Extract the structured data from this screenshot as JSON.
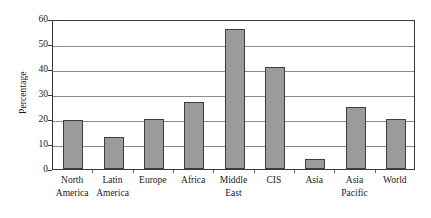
{
  "chart_data": {
    "type": "bar",
    "title": "",
    "xlabel": "",
    "ylabel": "Percentage",
    "categories": [
      "North America",
      "Latin America",
      "Europe",
      "Africa",
      "Middle East",
      "CIS",
      "Asia",
      "Asia Pacific",
      "World"
    ],
    "category_lines": [
      [
        "North",
        "America"
      ],
      [
        "Latin",
        "America"
      ],
      [
        "Europe",
        ""
      ],
      [
        "Africa",
        ""
      ],
      [
        "Middle",
        "East"
      ],
      [
        "CIS",
        ""
      ],
      [
        "Asia",
        ""
      ],
      [
        "Asia",
        "Pacific"
      ],
      [
        "World",
        ""
      ]
    ],
    "values": [
      19.5,
      13,
      20,
      27,
      56,
      41,
      4,
      25,
      20
    ],
    "ylim": [
      0,
      60
    ],
    "yticks": [
      0,
      10,
      20,
      30,
      40,
      50,
      60
    ],
    "ytick_labels": [
      "0",
      "10",
      "20",
      "30",
      "40",
      "50",
      "60"
    ],
    "grid": true,
    "legend": null,
    "bar_color": "#9b9b9b",
    "bar_border_color": "#3d3d3d",
    "grid_color": "#8c8c8c",
    "frame_color": "#3a3a3a",
    "background": "#ffffff"
  }
}
